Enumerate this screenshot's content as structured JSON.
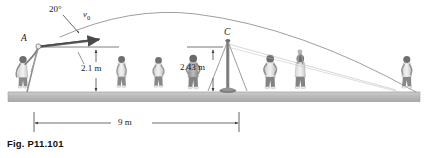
{
  "figure": {
    "caption": "Fig. P11.101",
    "type": "projectile-trajectory-diagram",
    "background": "#ffffff",
    "ink_color": "#3c3c3c",
    "ground_color": "#b9b9b9"
  },
  "labels": {
    "launch_angle": "20°",
    "initial_velocity": "v",
    "initial_velocity_sub": "0",
    "point_a": "A",
    "point_c": "C",
    "height_a": "2.1 m",
    "height_c": "2.43 m",
    "horizontal_distance": "9 m"
  },
  "icon_names": [
    "trajectory-curve-icon",
    "velocity-arrow-icon",
    "angle-leader-icon",
    "dimension-arrow-icon",
    "tripod-stand-icon",
    "pole-icon",
    "person-icon",
    "ground-strip-icon"
  ],
  "people": [
    {
      "name": "thrower-person",
      "x": 14,
      "scale": 1.0
    },
    {
      "name": "bystander-person",
      "x": 117,
      "scale": 0.92
    },
    {
      "name": "bystander-person",
      "x": 154,
      "scale": 0.9
    },
    {
      "name": "bystander-person",
      "x": 190,
      "scale": 0.96
    },
    {
      "name": "bystander-person",
      "x": 265,
      "scale": 0.94
    },
    {
      "name": "catcher-person",
      "x": 295,
      "scale": 0.94
    },
    {
      "name": "far-person",
      "x": 402,
      "scale": 0.9
    }
  ],
  "geometry": {
    "ground_top_y": 92,
    "ground_bottom_y": 101,
    "launch_point": {
      "x": 38,
      "y": 46
    },
    "apex": {
      "x": 196,
      "y": 14
    },
    "landing": {
      "x": 416,
      "y": 92
    },
    "pole_x": 228,
    "pole_top_y": 40,
    "dim_2_1_x": 96,
    "dim_2_43_x": 213,
    "dim_9m_left": 34,
    "dim_9m_right": 239,
    "dim_9m_y": 123
  }
}
